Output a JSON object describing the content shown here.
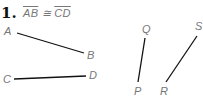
{
  "problem": {
    "number": "1.",
    "statement": {
      "left_segment": "AB",
      "relation": "≅",
      "right_segment": "CD"
    }
  },
  "diagram": {
    "segments": [
      {
        "name": "AB",
        "p1": {
          "label": "A",
          "x": 17,
          "y": 33
        },
        "p2": {
          "label": "B",
          "x": 84,
          "y": 53
        }
      },
      {
        "name": "CD",
        "p1": {
          "label": "C",
          "x": 14,
          "y": 79
        },
        "p2": {
          "label": "D",
          "x": 86,
          "y": 76
        }
      },
      {
        "name": "PQ",
        "p1": {
          "label": "P",
          "x": 138,
          "y": 82
        },
        "p2": {
          "label": "Q",
          "x": 145,
          "y": 38
        }
      },
      {
        "name": "RS",
        "p1": {
          "label": "R",
          "x": 166,
          "y": 82
        },
        "p2": {
          "label": "S",
          "x": 197,
          "y": 36
        }
      }
    ],
    "labels": {
      "A": "A",
      "B": "B",
      "C": "C",
      "D": "D",
      "P": "P",
      "Q": "Q",
      "R": "R",
      "S": "S"
    }
  }
}
